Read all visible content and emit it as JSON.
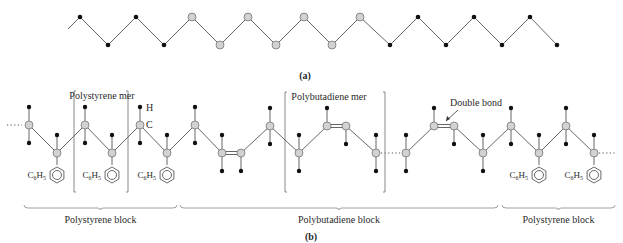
{
  "figure": {
    "panel_a": {
      "label": "(a)",
      "start_point": [
        68,
        29
      ],
      "nodes": [
        {
          "x": 80,
          "y": 17,
          "type": "black"
        },
        {
          "x": 108,
          "y": 45,
          "type": "black"
        },
        {
          "x": 136,
          "y": 17,
          "type": "black"
        },
        {
          "x": 164,
          "y": 45,
          "type": "black"
        },
        {
          "x": 192,
          "y": 17,
          "type": "gray"
        },
        {
          "x": 220,
          "y": 45,
          "type": "gray"
        },
        {
          "x": 248,
          "y": 17,
          "type": "gray"
        },
        {
          "x": 276,
          "y": 45,
          "type": "gray"
        },
        {
          "x": 304,
          "y": 17,
          "type": "gray"
        },
        {
          "x": 332,
          "y": 45,
          "type": "gray"
        },
        {
          "x": 360,
          "y": 17,
          "type": "gray"
        },
        {
          "x": 390,
          "y": 45,
          "type": "black"
        },
        {
          "x": 418,
          "y": 17,
          "type": "black"
        },
        {
          "x": 446,
          "y": 45,
          "type": "black"
        },
        {
          "x": 474,
          "y": 17,
          "type": "black"
        },
        {
          "x": 502,
          "y": 45,
          "type": "black"
        },
        {
          "x": 530,
          "y": 17,
          "type": "black"
        },
        {
          "x": 557,
          "y": 45,
          "type": "black"
        }
      ]
    },
    "panel_b": {
      "label": "(b)",
      "left_ellipsis": "...",
      "right_ellipsis": "...",
      "atom_labels": {
        "hydrogen": "H",
        "carbon": "C"
      },
      "mer_labels": {
        "polystyrene": "Polystyrene mer",
        "polybutadiene": "Polybutadiene mer"
      },
      "annotation": "Double bond",
      "substituent_label": "C6H5",
      "blocks": [
        {
          "label": "Polystyrene block",
          "x1": 24,
          "x2": 177
        },
        {
          "label": "Polybutadiene block",
          "x1": 180,
          "x2": 498
        },
        {
          "label": "Polystyrene block",
          "x1": 502,
          "x2": 615
        }
      ],
      "segments": [
        {
          "nodes": [
            {
              "x": 29,
              "y": 125,
              "up": true,
              "down": true
            },
            {
              "x": 57,
              "y": 153,
              "up_offset": true,
              "phenyl": true
            },
            {
              "x": 85,
              "y": 125,
              "up": true,
              "down": true
            },
            {
              "x": 112,
              "y": 153,
              "up_offset": true,
              "phenyl": true
            },
            {
              "x": 140,
              "y": 125,
              "up": true,
              "down": true
            },
            {
              "x": 167,
              "y": 153,
              "up_offset": true,
              "phenyl": true
            },
            {
              "x": 195,
              "y": 125,
              "up": true,
              "down": true
            },
            {
              "x": 222,
              "y": 153,
              "up_offset": true,
              "down": true
            },
            {
              "x": 241,
              "y": 153,
              "down": true,
              "double_with_prev": true
            },
            {
              "x": 270,
              "y": 126,
              "up": true,
              "down": true
            },
            {
              "x": 299,
              "y": 153,
              "up_offset": true,
              "down": true
            },
            {
              "x": 327,
              "y": 126,
              "up": true
            },
            {
              "x": 346,
              "y": 126,
              "down": true,
              "double_with_prev": true
            },
            {
              "x": 376,
              "y": 153,
              "up_offset": true,
              "down": true
            }
          ]
        },
        {
          "nodes": [
            {
              "x": 406,
              "y": 153,
              "up_offset": true,
              "down": true
            },
            {
              "x": 434,
              "y": 126,
              "up": true
            },
            {
              "x": 454,
              "y": 126,
              "down": true,
              "double_with_prev": true
            },
            {
              "x": 483,
              "y": 153,
              "up_offset": true,
              "down": true
            },
            {
              "x": 511,
              "y": 126,
              "up": true,
              "down": true
            },
            {
              "x": 539,
              "y": 153,
              "up_offset": true,
              "phenyl": true
            },
            {
              "x": 566,
              "y": 126,
              "up": true,
              "down": true
            },
            {
              "x": 594,
              "y": 153,
              "up_offset": true,
              "phenyl": true
            }
          ]
        }
      ],
      "brackets": [
        {
          "x1": 74,
          "x2": 128,
          "y1": 91,
          "y2": 192
        },
        {
          "x1": 285,
          "x2": 385,
          "y1": 92,
          "y2": 192
        }
      ]
    }
  }
}
